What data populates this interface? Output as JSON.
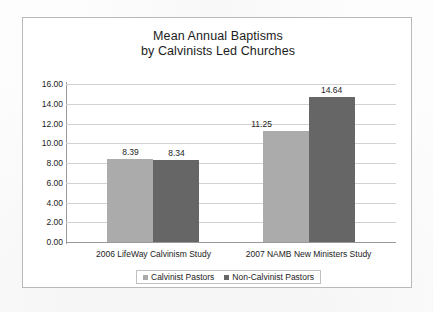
{
  "chart_data": {
    "type": "bar",
    "title": "Mean Annual Baptisms by Calvinists Led Churches",
    "title_lines": [
      "Mean Annual Baptisms",
      "by Calvinists Led Churches"
    ],
    "xlabel": "",
    "ylabel": "",
    "ylim": [
      0,
      16
    ],
    "ytick_step": 2,
    "ytick_labels": [
      "16.00",
      "14.00",
      "12.00",
      "10.00",
      "8.00",
      "6.00",
      "4.00",
      "2.00",
      "0.00"
    ],
    "ytick_values": [
      16,
      14,
      12,
      10,
      8,
      6,
      4,
      2,
      0
    ],
    "grid": "horizontal",
    "legend_position": "bottom",
    "categories": [
      "2006 LifeWay Calvinism Study",
      "2007 NAMB New Ministers Study"
    ],
    "series": [
      {
        "name": "Calvinist Pastors",
        "color": "#ababab",
        "values": [
          8.39,
          11.25
        ],
        "labels": [
          "8.39",
          "11.25"
        ]
      },
      {
        "name": "Non-Calvinist Pastors",
        "color": "#666666",
        "values": [
          8.34,
          14.64
        ],
        "labels": [
          "8.34",
          "14.64"
        ]
      }
    ]
  },
  "colors": {
    "series_light": "#ababab",
    "series_dark": "#666666",
    "gridline": "#d2d2d2",
    "axis": "#9a9a9a",
    "frame_border": "#b9b9b9",
    "text": "#1c1c1c",
    "background": "#ffffff"
  }
}
